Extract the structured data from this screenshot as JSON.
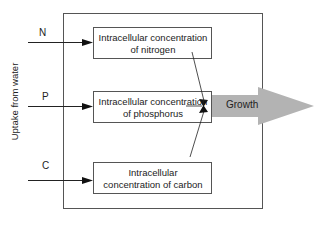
{
  "diagram": {
    "side_label": "Uptake from water",
    "inputs": [
      {
        "label": "N"
      },
      {
        "label": "P"
      },
      {
        "label": "C"
      }
    ],
    "boxes": [
      {
        "line1": "Intracellular concentration",
        "line2": "of nitrogen"
      },
      {
        "line1": "Intracellular concentration",
        "line2": "of phosphorus"
      },
      {
        "line1": "Intracellular",
        "line2": "concentration of carbon"
      }
    ],
    "output": {
      "label": "Growth"
    },
    "colors": {
      "line": "#222222",
      "box_border": "#555555",
      "outer_border": "#555555",
      "arrow_fill": "#b3b3b3"
    }
  }
}
